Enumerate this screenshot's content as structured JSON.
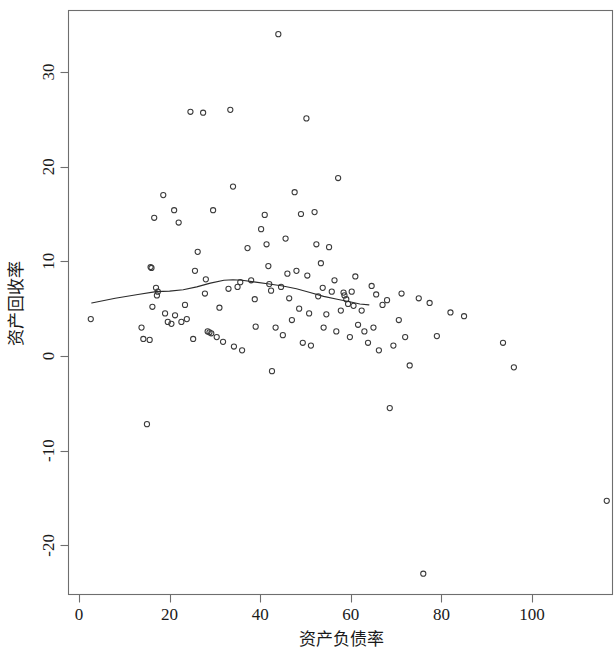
{
  "chart_data": {
    "type": "scatter",
    "title": "",
    "xlabel": "资产负债率",
    "ylabel": "资产回收率",
    "xlim": [
      -2.5,
      119
    ],
    "ylim": [
      -24.5,
      35.5
    ],
    "grid": false,
    "legend": null,
    "xticks": [
      0,
      20,
      40,
      60,
      80,
      100
    ],
    "xticklabels": [
      "0",
      "20",
      "40",
      "60",
      "80",
      "100"
    ],
    "yticks": [
      -20,
      -10,
      0,
      10,
      20,
      30
    ],
    "yticklabels": [
      "-20",
      "-10",
      "0",
      "10",
      "20",
      "30"
    ],
    "marker": "open-circle",
    "marker_color": "#3a3a3a",
    "points": [
      [
        2.6,
        3.9
      ],
      [
        13.8,
        3.0
      ],
      [
        14.2,
        1.8
      ],
      [
        15.0,
        -7.2
      ],
      [
        15.6,
        1.7
      ],
      [
        15.8,
        9.4
      ],
      [
        16.0,
        9.3
      ],
      [
        16.2,
        5.2
      ],
      [
        16.6,
        14.6
      ],
      [
        17.0,
        7.2
      ],
      [
        17.2,
        6.4
      ],
      [
        17.4,
        6.8
      ],
      [
        18.6,
        17.0
      ],
      [
        19.0,
        4.5
      ],
      [
        19.6,
        3.6
      ],
      [
        20.4,
        3.4
      ],
      [
        21.0,
        15.4
      ],
      [
        21.2,
        4.3
      ],
      [
        22.0,
        14.1
      ],
      [
        22.6,
        3.6
      ],
      [
        23.4,
        5.4
      ],
      [
        23.8,
        3.9
      ],
      [
        24.6,
        25.8
      ],
      [
        25.2,
        1.8
      ],
      [
        25.6,
        9.0
      ],
      [
        26.2,
        11.0
      ],
      [
        27.4,
        25.7
      ],
      [
        27.8,
        6.6
      ],
      [
        28.0,
        8.1
      ],
      [
        28.4,
        2.6
      ],
      [
        28.8,
        2.5
      ],
      [
        29.2,
        2.4
      ],
      [
        29.6,
        15.4
      ],
      [
        30.4,
        2.0
      ],
      [
        31.0,
        5.1
      ],
      [
        31.8,
        1.5
      ],
      [
        33.0,
        7.1
      ],
      [
        33.4,
        26.0
      ],
      [
        34.0,
        17.9
      ],
      [
        34.2,
        1.0
      ],
      [
        35.0,
        7.3
      ],
      [
        35.6,
        7.8
      ],
      [
        36.0,
        0.6
      ],
      [
        37.2,
        11.4
      ],
      [
        38.0,
        8.0
      ],
      [
        38.8,
        6.0
      ],
      [
        39.0,
        3.1
      ],
      [
        40.2,
        13.4
      ],
      [
        41.0,
        14.9
      ],
      [
        41.4,
        11.8
      ],
      [
        41.8,
        9.5
      ],
      [
        42.0,
        7.6
      ],
      [
        42.4,
        6.9
      ],
      [
        42.6,
        -1.6
      ],
      [
        43.4,
        3.0
      ],
      [
        44.0,
        34.0
      ],
      [
        44.6,
        7.3
      ],
      [
        45.0,
        2.2
      ],
      [
        45.6,
        12.4
      ],
      [
        46.0,
        8.7
      ],
      [
        46.4,
        6.1
      ],
      [
        47.0,
        3.8
      ],
      [
        47.6,
        17.3
      ],
      [
        48.0,
        9.0
      ],
      [
        48.6,
        5.0
      ],
      [
        49.0,
        15.0
      ],
      [
        49.4,
        1.4
      ],
      [
        50.2,
        25.1
      ],
      [
        50.4,
        8.5
      ],
      [
        50.8,
        4.5
      ],
      [
        51.2,
        1.1
      ],
      [
        52.0,
        15.2
      ],
      [
        52.4,
        11.8
      ],
      [
        52.8,
        6.3
      ],
      [
        53.4,
        9.8
      ],
      [
        53.8,
        7.2
      ],
      [
        54.0,
        3.0
      ],
      [
        54.6,
        4.4
      ],
      [
        55.2,
        11.5
      ],
      [
        55.8,
        6.8
      ],
      [
        56.4,
        8.0
      ],
      [
        56.8,
        2.6
      ],
      [
        57.2,
        18.8
      ],
      [
        57.8,
        4.8
      ],
      [
        58.4,
        6.7
      ],
      [
        58.6,
        6.4
      ],
      [
        59.0,
        6.0
      ],
      [
        59.4,
        5.5
      ],
      [
        59.8,
        2.0
      ],
      [
        60.2,
        6.8
      ],
      [
        60.6,
        5.3
      ],
      [
        61.0,
        8.4
      ],
      [
        61.6,
        3.3
      ],
      [
        62.4,
        4.8
      ],
      [
        63.0,
        2.6
      ],
      [
        63.8,
        1.4
      ],
      [
        64.6,
        7.4
      ],
      [
        65.0,
        3.0
      ],
      [
        65.6,
        6.5
      ],
      [
        66.2,
        0.6
      ],
      [
        67.0,
        5.4
      ],
      [
        68.0,
        5.9
      ],
      [
        68.6,
        -5.5
      ],
      [
        69.4,
        1.1
      ],
      [
        70.6,
        3.8
      ],
      [
        71.2,
        6.6
      ],
      [
        72.0,
        2.0
      ],
      [
        73.0,
        -1.0
      ],
      [
        75.0,
        6.1
      ],
      [
        76.0,
        -23.0
      ],
      [
        77.4,
        5.6
      ],
      [
        79.0,
        2.1
      ],
      [
        82.0,
        4.6
      ],
      [
        85.0,
        4.2
      ],
      [
        93.6,
        1.4
      ],
      [
        96.0,
        -1.2
      ],
      [
        116.5,
        -15.3
      ]
    ],
    "smooth_curve": {
      "name": "lowess-smooth",
      "color": "#2b2b2b",
      "points": [
        [
          2.8,
          5.6
        ],
        [
          8.0,
          6.1
        ],
        [
          13.0,
          6.5
        ],
        [
          17.0,
          6.8
        ],
        [
          20.0,
          6.85
        ],
        [
          23.0,
          7.0
        ],
        [
          26.0,
          7.3
        ],
        [
          29.0,
          7.7
        ],
        [
          32.0,
          8.0
        ],
        [
          34.0,
          8.05
        ],
        [
          36.0,
          8.0
        ],
        [
          39.0,
          7.8
        ],
        [
          42.0,
          7.6
        ],
        [
          45.0,
          7.4
        ],
        [
          48.0,
          7.1
        ],
        [
          51.0,
          6.7
        ],
        [
          54.0,
          6.3
        ],
        [
          57.0,
          6.0
        ],
        [
          60.0,
          5.7
        ],
        [
          62.0,
          5.5
        ],
        [
          64.0,
          5.4
        ]
      ]
    }
  },
  "axis": {
    "x_title": "资产负债率",
    "y_title": "资产回收率"
  }
}
